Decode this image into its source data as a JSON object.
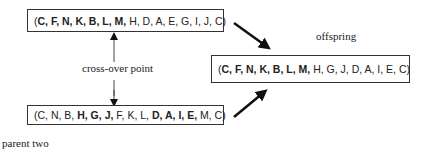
{
  "parent_one": {
    "genes": [
      {
        "v": "C",
        "bold": true
      },
      {
        "v": "F",
        "bold": true
      },
      {
        "v": "N",
        "bold": true
      },
      {
        "v": "K",
        "bold": true
      },
      {
        "v": "B",
        "bold": true
      },
      {
        "v": "L",
        "bold": true
      },
      {
        "v": "M",
        "bold": true
      },
      {
        "v": "H",
        "bold": false
      },
      {
        "v": "D",
        "bold": false
      },
      {
        "v": "A",
        "bold": false
      },
      {
        "v": "E",
        "bold": false
      },
      {
        "v": "G",
        "bold": false
      },
      {
        "v": "I",
        "bold": false
      },
      {
        "v": "J",
        "bold": false
      },
      {
        "v": "C",
        "bold": false
      }
    ]
  },
  "parent_two": {
    "label": "parent two",
    "genes": [
      {
        "v": "C",
        "bold": false
      },
      {
        "v": "N",
        "bold": false
      },
      {
        "v": "B",
        "bold": false
      },
      {
        "v": "H",
        "bold": true
      },
      {
        "v": "G",
        "bold": true
      },
      {
        "v": "J",
        "bold": true
      },
      {
        "v": "F",
        "bold": false
      },
      {
        "v": "K",
        "bold": false
      },
      {
        "v": "L",
        "bold": false
      },
      {
        "v": "D",
        "bold": true
      },
      {
        "v": "A",
        "bold": true
      },
      {
        "v": "I",
        "bold": true
      },
      {
        "v": "E",
        "bold": true
      },
      {
        "v": "M",
        "bold": false
      },
      {
        "v": "C",
        "bold": false
      }
    ]
  },
  "offspring": {
    "label": "offspring",
    "genes": [
      {
        "v": "C",
        "bold": true
      },
      {
        "v": "F",
        "bold": true
      },
      {
        "v": "N",
        "bold": true
      },
      {
        "v": "K",
        "bold": true
      },
      {
        "v": "B",
        "bold": true
      },
      {
        "v": "L",
        "bold": true
      },
      {
        "v": "M",
        "bold": true
      },
      {
        "v": "H",
        "bold": false
      },
      {
        "v": "G",
        "bold": false
      },
      {
        "v": "J",
        "bold": false
      },
      {
        "v": "D",
        "bold": false
      },
      {
        "v": "A",
        "bold": false
      },
      {
        "v": "I",
        "bold": false
      },
      {
        "v": "E",
        "bold": false
      },
      {
        "v": "C",
        "bold": false
      }
    ]
  },
  "crossover": {
    "label": "cross-over point"
  },
  "colors": {
    "line": "#333333",
    "arrow": "#111111"
  }
}
